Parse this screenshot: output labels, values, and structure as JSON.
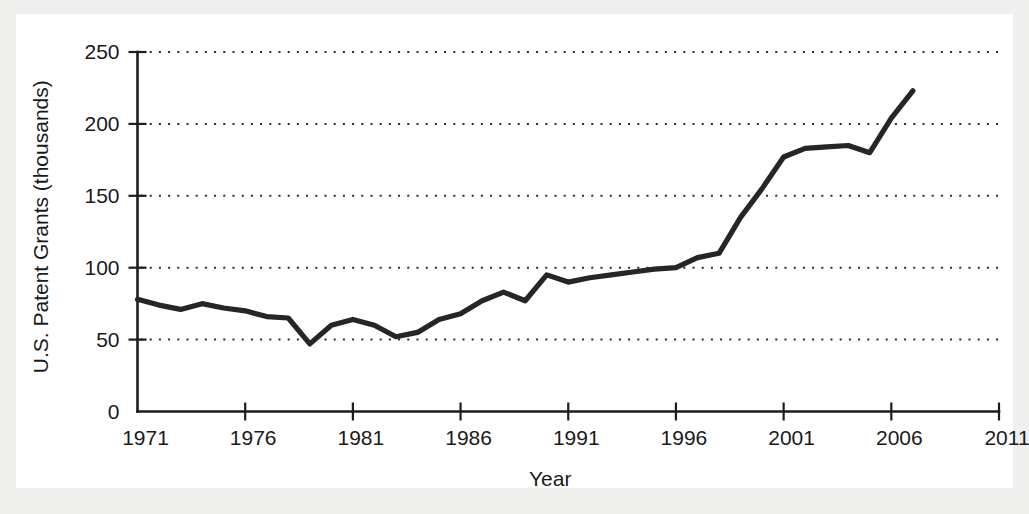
{
  "chart_data": {
    "type": "line",
    "title": "",
    "xlabel": "Year",
    "ylabel": "U.S. Patent Grants (thousands)",
    "xlim": [
      1971,
      2011
    ],
    "ylim": [
      0,
      250
    ],
    "grid": true,
    "grid_orientation": "horizontal",
    "grid_style": "dotted",
    "legend": "none",
    "line_color": "#262626",
    "background_color": "#ffffff",
    "page_background_color": "#efefee",
    "xticks": [
      1971,
      1976,
      1981,
      1986,
      1991,
      1996,
      2001,
      2006,
      2011
    ],
    "xtick_labels": [
      "1971",
      "1976",
      "1981",
      "1986",
      "1991",
      "1996",
      "2001",
      "2006",
      "2011"
    ],
    "yticks": [
      0,
      50,
      100,
      150,
      200,
      250
    ],
    "ytick_labels": [
      "0",
      "50",
      "100",
      "150",
      "200",
      "250"
    ],
    "x": [
      1971,
      1972,
      1973,
      1974,
      1975,
      1976,
      1977,
      1978,
      1979,
      1980,
      1981,
      1982,
      1983,
      1984,
      1985,
      1986,
      1987,
      1988,
      1989,
      1990,
      1991,
      1992,
      1993,
      1994,
      1995,
      1996,
      1997,
      1998,
      1999,
      2000,
      2001,
      2002,
      2003,
      2004,
      2005,
      2006,
      2007
    ],
    "values": [
      78,
      74,
      71,
      75,
      72,
      70,
      66,
      65,
      47,
      60,
      64,
      60,
      52,
      55,
      64,
      68,
      77,
      83,
      77,
      95,
      90,
      93,
      95,
      97,
      99,
      100,
      107,
      110,
      135,
      155,
      177,
      183,
      184,
      185,
      180,
      204,
      223
    ],
    "series": [
      {
        "name": "U.S. Patent Grants",
        "values": [
          78,
          74,
          71,
          75,
          72,
          70,
          66,
          65,
          47,
          60,
          64,
          60,
          52,
          55,
          64,
          68,
          77,
          83,
          77,
          95,
          90,
          93,
          95,
          97,
          99,
          100,
          107,
          110,
          135,
          155,
          177,
          183,
          184,
          185,
          180,
          204,
          223
        ]
      }
    ]
  }
}
